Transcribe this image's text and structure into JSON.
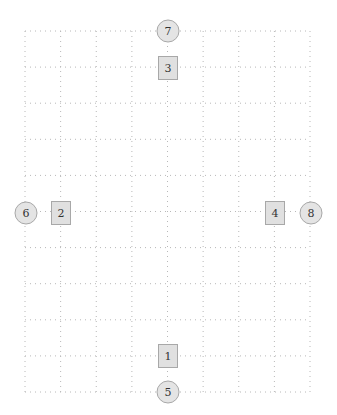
{
  "diagram": {
    "width": 337,
    "height": 415,
    "grid": {
      "x0": 25,
      "y0": 31,
      "x1": 310,
      "y1": 392,
      "cols": 8,
      "rows": 10,
      "line_color": "#b8b8b8"
    },
    "node_style": {
      "fill": "#e0e0e0",
      "stroke": "#a8a8a8",
      "circle_fill": "#e4e4e4",
      "circle_stroke": "#a8a8a8"
    },
    "boxes": [
      {
        "id": "1",
        "label": "1",
        "cx": 168,
        "cy": 356
      },
      {
        "id": "2",
        "label": "2",
        "cx": 61,
        "cy": 213
      },
      {
        "id": "3",
        "label": "3",
        "cx": 168,
        "cy": 68
      },
      {
        "id": "4",
        "label": "4",
        "cx": 275,
        "cy": 213
      }
    ],
    "circles": [
      {
        "id": "5",
        "label": "5",
        "cx": 168,
        "cy": 392
      },
      {
        "id": "6",
        "label": "6",
        "cx": 26,
        "cy": 213
      },
      {
        "id": "7",
        "label": "7",
        "cx": 168,
        "cy": 31
      },
      {
        "id": "8",
        "label": "8",
        "cx": 311,
        "cy": 213
      }
    ]
  }
}
